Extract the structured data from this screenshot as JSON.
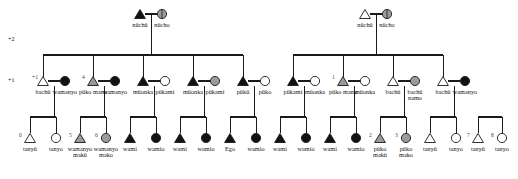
{
  "diagram": {
    "colors": {
      "line": "#1a1a1a",
      "filled": "#121212",
      "shaded": "#9a9a9a",
      "open": "#ffffff",
      "text": "#111111"
    },
    "generation_labels": [
      {
        "text": "+2",
        "x": 8,
        "y": 36
      },
      {
        "text": "+1",
        "x": 8,
        "y": 77
      }
    ],
    "gen2": {
      "couples": [
        {
          "male_label": "nüchü",
          "female_label": "nücho",
          "male_fill": "filled",
          "female_fill": "shaded",
          "x": 140,
          "y": 14
        },
        {
          "male_label": "nüchü",
          "female_label": "nücho",
          "male_fill": "open",
          "female_fill": "shaded",
          "x": 365,
          "y": 14
        }
      ]
    },
    "gen1": {
      "couples": [
        {
          "num": "+1",
          "male_label": "bachü",
          "female_label": "wamanyo",
          "male_fill": "open",
          "female_fill": "filled",
          "x": 43
        },
        {
          "num": "4",
          "male_label": "püko manu",
          "female_label": "wamanyo",
          "male_fill": "shaded",
          "female_fill": "filled",
          "x": 93
        },
        {
          "num": "",
          "male_label": "müonka",
          "female_label": "pükami",
          "male_fill": "filled",
          "female_fill": "open",
          "x": 143
        },
        {
          "num": "",
          "male_label": "müonka",
          "female_label": "pükami",
          "male_fill": "filled",
          "female_fill": "shaded",
          "x": 193
        },
        {
          "num": "",
          "male_label": "pükü",
          "female_label": "püko",
          "male_fill": "filled",
          "female_fill": "open",
          "x": 243
        },
        {
          "num": "",
          "male_label": "pükami",
          "female_label": "müonka",
          "male_fill": "filled",
          "female_fill": "open",
          "x": 293
        },
        {
          "num": "1",
          "male_label": "püko manu",
          "female_label": "müonka",
          "male_fill": "shaded",
          "female_fill": "open",
          "x": 343
        },
        {
          "num": "",
          "male_label": "bachü",
          "female_label": "bachü namo",
          "male_fill": "open",
          "female_fill": "shaded",
          "x": 393
        },
        {
          "num": "",
          "male_label": "bachü",
          "female_label": "wamanyo",
          "male_fill": "open",
          "female_fill": "filled",
          "x": 443
        }
      ]
    },
    "gen0": {
      "sibsets": [
        {
          "left": {
            "num": "0",
            "label": "tanyü",
            "shape": "triangle",
            "fill": "open",
            "x": 30
          },
          "right": {
            "num": "",
            "label": "tanyo",
            "shape": "circle",
            "fill": "open",
            "x": 56
          }
        },
        {
          "left": {
            "num": "5",
            "label": "wamanyo makü",
            "shape": "triangle",
            "fill": "shaded",
            "x": 80
          },
          "right": {
            "num": "6",
            "label": "wamanyo mako",
            "shape": "circle",
            "fill": "shaded",
            "x": 106
          }
        },
        {
          "left": {
            "num": "",
            "label": "wami",
            "shape": "triangle",
            "fill": "filled",
            "x": 130
          },
          "right": {
            "num": "",
            "label": "wamio",
            "shape": "circle",
            "fill": "filled",
            "x": 156
          }
        },
        {
          "left": {
            "num": "",
            "label": "wami",
            "shape": "triangle",
            "fill": "filled",
            "x": 180
          },
          "right": {
            "num": "",
            "label": "wamio",
            "shape": "circle",
            "fill": "filled",
            "x": 206
          }
        },
        {
          "left": {
            "num": "",
            "label": "Ego",
            "shape": "triangle",
            "fill": "filled",
            "x": 230
          },
          "right": {
            "num": "",
            "label": "wamio",
            "shape": "circle",
            "fill": "filled",
            "x": 256
          }
        },
        {
          "left": {
            "num": "",
            "label": "wami",
            "shape": "triangle",
            "fill": "filled",
            "x": 280
          },
          "right": {
            "num": "",
            "label": "wamio",
            "shape": "circle",
            "fill": "filled",
            "x": 306
          }
        },
        {
          "left": {
            "num": "",
            "label": "wami",
            "shape": "triangle",
            "fill": "filled",
            "x": 330
          },
          "right": {
            "num": "",
            "label": "wamio",
            "shape": "circle",
            "fill": "filled",
            "x": 356
          }
        },
        {
          "left": {
            "num": "2",
            "label": "püko makü",
            "shape": "triangle",
            "fill": "shaded",
            "x": 380
          },
          "right": {
            "num": "3",
            "label": "püko mako",
            "shape": "circle",
            "fill": "shaded",
            "x": 406
          }
        },
        {
          "left": {
            "num": "",
            "label": "tanyü",
            "shape": "triangle",
            "fill": "open",
            "x": 430
          },
          "right": {
            "num": "",
            "label": "tanyo",
            "shape": "circle",
            "fill": "open",
            "x": 456
          }
        },
        {
          "left": {
            "num": "7",
            "label": "tanyü",
            "shape": "triangle",
            "fill": "open",
            "x": 478
          },
          "right": {
            "num": "8",
            "label": "tanyo",
            "shape": "circle",
            "fill": "open",
            "x": 502
          }
        }
      ]
    }
  }
}
